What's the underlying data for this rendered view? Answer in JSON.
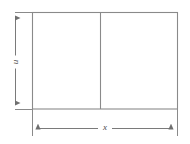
{
  "diagram": {
    "type": "geometry-rectangle-dimensioned",
    "title": "",
    "background_color": "#ffffff",
    "stroke_color": "#8a8a8a",
    "stroke_color_dark": "#707070",
    "text_color": "#4a4a4a",
    "shape": {
      "name": "rectangle",
      "left": 32,
      "top": 12,
      "right": 177,
      "bottom": 109,
      "width": 145,
      "height": 97,
      "fill": "none"
    },
    "divider": {
      "name": "interior-vertical-divider",
      "x": 100,
      "top": 12,
      "bottom": 109,
      "panes": 2
    },
    "dimensions": [
      {
        "id": "height",
        "label": "u",
        "orientation": "vertical",
        "axis_position": 15,
        "from": 12,
        "to": 109,
        "arrowheads": "both",
        "label_rotation_deg": -90
      },
      {
        "id": "width",
        "label": "x",
        "orientation": "horizontal",
        "axis_position": 128,
        "from": 32,
        "to": 177,
        "arrowheads": "both",
        "label_rotation_deg": 0
      }
    ],
    "extension_lines": [
      {
        "id": "left-edge-extension",
        "x": 32,
        "from_y": 109,
        "to_y": 136
      },
      {
        "id": "right-edge-extension",
        "x": 177,
        "from_y": 109,
        "to_y": 136
      },
      {
        "id": "top-edge-extension",
        "y": 12,
        "from_x": 15,
        "to_x": 32
      },
      {
        "id": "bottom-edge-extension",
        "y": 109,
        "from_x": 15,
        "to_x": 32
      }
    ]
  }
}
